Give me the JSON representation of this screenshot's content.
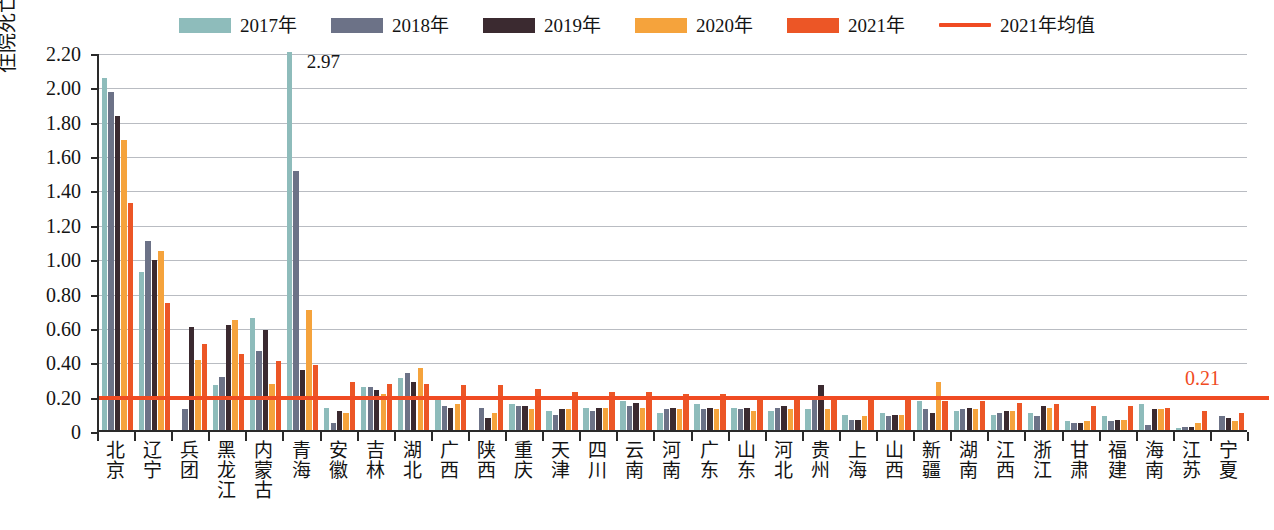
{
  "chart_data": {
    "type": "bar",
    "title": "",
    "xlabel": "",
    "ylabel": "住院死亡率（%）",
    "ylim": [
      0,
      2.2
    ],
    "ytick_labels": [
      "2.20",
      "2.00",
      "1.80",
      "1.60",
      "1.40",
      "1.20",
      "1.00",
      "0.80",
      "0.60",
      "0.40",
      "0.20",
      "0"
    ],
    "ytick_values": [
      2.2,
      2.0,
      1.8,
      1.6,
      1.4,
      1.2,
      1.0,
      0.8,
      0.6,
      0.4,
      0.2,
      0
    ],
    "grid": true,
    "legend_position": "top-center",
    "categories": [
      "北京",
      "辽宁",
      "兵团",
      "黑龙江",
      "内蒙古",
      "青海",
      "安徽",
      "吉林",
      "湖北",
      "广西",
      "陕西",
      "重庆",
      "天津",
      "四川",
      "云南",
      "河南",
      "广东",
      "山东",
      "河北",
      "贵州",
      "上海",
      "山西",
      "新疆",
      "湖南",
      "江西",
      "浙江",
      "甘肃",
      "福建",
      "海南",
      "江苏",
      "宁夏"
    ],
    "series": [
      {
        "name": "2017年",
        "color": "#8ebcbb",
        "values": [
          2.05,
          0.92,
          0.0,
          0.26,
          0.65,
          2.97,
          0.13,
          0.25,
          0.3,
          0.18,
          0.0,
          0.15,
          0.11,
          0.13,
          0.17,
          0.1,
          0.15,
          0.13,
          0.11,
          0.12,
          0.09,
          0.1,
          0.17,
          0.11,
          0.09,
          0.1,
          0.05,
          0.08,
          0.15,
          0.01,
          0.0
        ]
      },
      {
        "name": "2018年",
        "color": "#6c7287",
        "values": [
          1.97,
          1.1,
          0.12,
          0.31,
          0.46,
          1.51,
          0.04,
          0.25,
          0.33,
          0.14,
          0.13,
          0.14,
          0.09,
          0.11,
          0.14,
          0.12,
          0.12,
          0.12,
          0.13,
          0.2,
          0.06,
          0.08,
          0.12,
          0.12,
          0.1,
          0.08,
          0.04,
          0.05,
          0.03,
          0.02,
          0.08
        ]
      },
      {
        "name": "2019年",
        "color": "#3b2a30",
        "values": [
          1.83,
          0.99,
          0.6,
          0.61,
          0.58,
          0.35,
          0.11,
          0.23,
          0.28,
          0.13,
          0.07,
          0.14,
          0.12,
          0.13,
          0.16,
          0.13,
          0.13,
          0.13,
          0.14,
          0.26,
          0.06,
          0.09,
          0.1,
          0.13,
          0.11,
          0.14,
          0.04,
          0.06,
          0.12,
          0.02,
          0.07
        ]
      },
      {
        "name": "2020年",
        "color": "#f5a33c",
        "values": [
          1.69,
          1.04,
          0.41,
          0.64,
          0.27,
          0.7,
          0.1,
          0.21,
          0.36,
          0.15,
          0.1,
          0.12,
          0.12,
          0.13,
          0.13,
          0.12,
          0.12,
          0.11,
          0.12,
          0.12,
          0.08,
          0.09,
          0.28,
          0.12,
          0.11,
          0.13,
          0.05,
          0.06,
          0.12,
          0.04,
          0.05
        ]
      },
      {
        "name": "2021年",
        "color": "#ec5626",
        "values": [
          1.32,
          0.74,
          0.5,
          0.44,
          0.4,
          0.38,
          0.28,
          0.27,
          0.27,
          0.26,
          0.26,
          0.24,
          0.22,
          0.22,
          0.22,
          0.21,
          0.21,
          0.2,
          0.2,
          0.19,
          0.19,
          0.18,
          0.17,
          0.17,
          0.16,
          0.15,
          0.14,
          0.14,
          0.13,
          0.11,
          0.1
        ]
      }
    ],
    "reference_line": {
      "label": "2021年均值",
      "value": 0.21,
      "value_label": "0.21",
      "color": "#f04b22"
    },
    "annotations": [
      {
        "category": "青海",
        "series": "2017年",
        "text": "2.97",
        "clipped": true
      }
    ]
  },
  "legend": {
    "items": [
      {
        "label": "2017年",
        "color": "#8ebcbb",
        "type": "swatch",
        "icon": "legend-swatch-icon"
      },
      {
        "label": "2018年",
        "color": "#6c7287",
        "type": "swatch",
        "icon": "legend-swatch-icon"
      },
      {
        "label": "2019年",
        "color": "#3b2a30",
        "type": "swatch",
        "icon": "legend-swatch-icon"
      },
      {
        "label": "2020年",
        "color": "#f5a33c",
        "type": "swatch",
        "icon": "legend-swatch-icon"
      },
      {
        "label": "2021年",
        "color": "#ec5626",
        "type": "swatch",
        "icon": "legend-swatch-icon"
      },
      {
        "label": "2021年均值",
        "color": "#f04b22",
        "type": "line",
        "icon": "legend-line-icon"
      }
    ]
  },
  "caption": ""
}
